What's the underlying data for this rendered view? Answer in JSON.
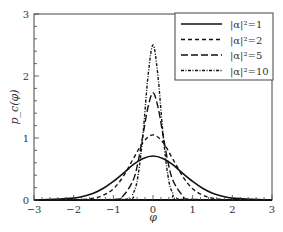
{
  "chart_data": {
    "type": "line",
    "title": "",
    "xlabel": "φ",
    "ylabel": "p_c(φ)",
    "xlim": [
      -3,
      3
    ],
    "ylim": [
      0,
      3
    ],
    "xticks": [
      -3,
      -2,
      -1,
      0,
      1,
      2,
      3
    ],
    "xtick_labels": [
      "−3",
      "−2",
      "−1",
      "0",
      "1",
      "2",
      "3"
    ],
    "yticks": [
      0,
      1,
      2,
      3
    ],
    "ytick_labels": [
      "0",
      "1",
      "2",
      "3"
    ],
    "grid": false,
    "legend_position": "upper right",
    "series": [
      {
        "name": "|α|²=1",
        "style": "solid",
        "x": [
          -3,
          -2.5,
          -2,
          -1.75,
          -1.5,
          -1.25,
          -1,
          -0.75,
          -0.5,
          -0.25,
          0,
          0.25,
          0.5,
          0.75,
          1,
          1.25,
          1.5,
          1.75,
          2,
          2.5,
          3
        ],
        "values": [
          0.0,
          0.01,
          0.03,
          0.06,
          0.11,
          0.19,
          0.3,
          0.43,
          0.57,
          0.67,
          0.71,
          0.67,
          0.57,
          0.43,
          0.3,
          0.19,
          0.11,
          0.06,
          0.03,
          0.01,
          0.0
        ]
      },
      {
        "name": "|α|²=2",
        "style": "dashed",
        "x": [
          -3,
          -2,
          -1.5,
          -1.25,
          -1,
          -0.75,
          -0.5,
          -0.25,
          0,
          0.25,
          0.5,
          0.75,
          1,
          1.25,
          1.5,
          2,
          3
        ],
        "values": [
          0.0,
          0.0,
          0.03,
          0.08,
          0.18,
          0.38,
          0.66,
          0.93,
          1.05,
          0.93,
          0.66,
          0.38,
          0.18,
          0.08,
          0.03,
          0.0,
          0.0
        ]
      },
      {
        "name": "|α|²=5",
        "style": "long-dashed",
        "x": [
          -3,
          -1,
          -0.75,
          -0.5,
          -0.375,
          -0.25,
          -0.125,
          0,
          0.125,
          0.25,
          0.375,
          0.5,
          0.75,
          1,
          3
        ],
        "values": [
          0.0,
          0.01,
          0.07,
          0.32,
          0.62,
          1.06,
          1.5,
          1.73,
          1.5,
          1.06,
          0.62,
          0.32,
          0.07,
          0.01,
          0.0
        ]
      },
      {
        "name": "|α|²=10",
        "style": "dash-dot",
        "x": [
          -3,
          -0.75,
          -0.5,
          -0.375,
          -0.25,
          -0.125,
          0,
          0.125,
          0.25,
          0.375,
          0.5,
          0.75,
          3
        ],
        "values": [
          0.0,
          0.01,
          0.11,
          0.4,
          1.08,
          2.0,
          2.5,
          2.0,
          1.08,
          0.4,
          0.11,
          0.01,
          0.0
        ]
      }
    ]
  },
  "legend": {
    "items": [
      {
        "label": "|α|²=1"
      },
      {
        "label": "|α|²=2"
      },
      {
        "label": "|α|²=5"
      },
      {
        "label": "|α|²=10"
      }
    ]
  }
}
